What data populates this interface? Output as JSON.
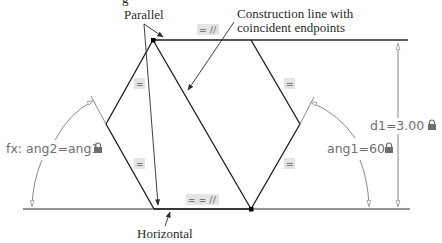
{
  "title_fragment": "g",
  "callouts": {
    "parallel": "Parallel",
    "construction_line": [
      "Construction line with",
      "coincident endpoints"
    ],
    "horizontal": "Horizontal"
  },
  "dimensions": {
    "d1": "d1=3.00",
    "ang1": "ang1=60",
    "ang2": "fx: ang2=ang1"
  },
  "constraint_badges": {
    "top_edge": "= //",
    "upper_left_edge": "=",
    "lower_left_edge": "=",
    "upper_right_edge": "=",
    "lower_right_edge": "=",
    "bottom_edge": "= = //"
  },
  "icons": {
    "lock": "lock-icon",
    "parallel": "parallel-icon",
    "equal": "equal-icon",
    "horizontal": "horizontal-icon"
  },
  "colors": {
    "geometry": "#1a1a1a",
    "dimension": "#7a7a7a",
    "badge_bg": "#e4e4e4",
    "callout_text": "#2a2a2a"
  }
}
